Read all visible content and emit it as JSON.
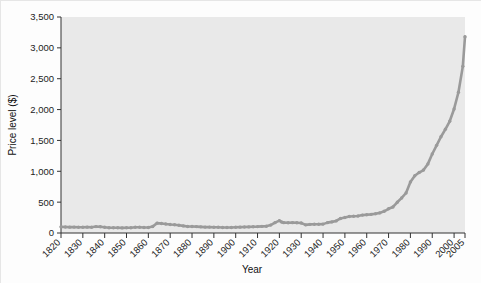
{
  "chart_data": {
    "type": "line",
    "title": "",
    "subtitle": "",
    "xlabel": "Year",
    "ylabel": "Price level ($)",
    "xlim": [
      1820,
      2005
    ],
    "ylim": [
      0,
      3500
    ],
    "grid": false,
    "legend": null,
    "legend_position": "none",
    "line_color": "#9a9a9a",
    "marker": "dot",
    "plot_background": "#e9e9e9",
    "figure_background": "#fdfdfd",
    "x_tick_labels": [
      "1820",
      "1830",
      "1840",
      "1850",
      "1860",
      "1870",
      "1880",
      "1890",
      "1900",
      "1910",
      "1920",
      "1930",
      "1940",
      "1950",
      "1960",
      "1970",
      "1980",
      "1990",
      "2000",
      "2005"
    ],
    "x_tick_values": [
      1820,
      1830,
      1840,
      1850,
      1860,
      1870,
      1880,
      1890,
      1900,
      1910,
      1920,
      1930,
      1940,
      1950,
      1960,
      1970,
      1980,
      1990,
      2000,
      2005
    ],
    "y_tick_labels": [
      "0",
      "500",
      "1,000",
      "1,500",
      "2,000",
      "2,500",
      "3,000",
      "3,500"
    ],
    "y_tick_values": [
      0,
      500,
      1000,
      1500,
      2000,
      2500,
      3000,
      3500
    ],
    "series": [
      {
        "name": "Price level",
        "x": [
          1820,
          1822,
          1824,
          1826,
          1828,
          1830,
          1832,
          1834,
          1836,
          1838,
          1840,
          1842,
          1844,
          1846,
          1848,
          1850,
          1852,
          1854,
          1856,
          1858,
          1860,
          1862,
          1864,
          1866,
          1868,
          1870,
          1872,
          1874,
          1876,
          1878,
          1880,
          1882,
          1884,
          1886,
          1888,
          1890,
          1892,
          1894,
          1896,
          1898,
          1900,
          1902,
          1904,
          1906,
          1908,
          1910,
          1912,
          1914,
          1916,
          1918,
          1920,
          1921,
          1922,
          1924,
          1926,
          1928,
          1930,
          1932,
          1934,
          1936,
          1938,
          1940,
          1942,
          1944,
          1946,
          1948,
          1950,
          1952,
          1954,
          1956,
          1958,
          1960,
          1962,
          1964,
          1966,
          1968,
          1970,
          1972,
          1974,
          1976,
          1978,
          1980,
          1982,
          1984,
          1986,
          1988,
          1990,
          1992,
          1994,
          1996,
          1998,
          2000,
          2002,
          2004,
          2005
        ],
        "y": [
          100,
          98,
          95,
          96,
          94,
          93,
          95,
          94,
          104,
          102,
          94,
          86,
          84,
          85,
          83,
          84,
          86,
          94,
          92,
          89,
          90,
          105,
          160,
          155,
          145,
          138,
          133,
          125,
          115,
          105,
          105,
          104,
          100,
          96,
          96,
          94,
          93,
          90,
          88,
          89,
          92,
          95,
          97,
          99,
          102,
          104,
          108,
          110,
          128,
          168,
          200,
          178,
          168,
          166,
          168,
          166,
          162,
          132,
          140,
          142,
          142,
          144,
          168,
          180,
          196,
          236,
          250,
          268,
          272,
          276,
          290,
          296,
          302,
          312,
          326,
          352,
          392,
          422,
          498,
          568,
          648,
          828,
          928,
          980,
          1020,
          1120,
          1280,
          1420,
          1560,
          1680,
          1810,
          2010,
          2280,
          2700,
          3180
        ]
      }
    ]
  }
}
